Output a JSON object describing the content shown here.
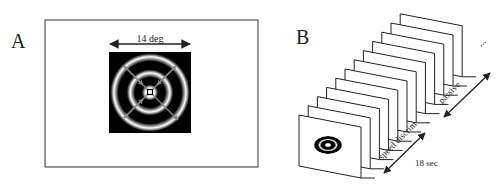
{
  "panel_a": {
    "label": "A",
    "width_label": "14 deg",
    "stimulus": "concentric-ring-grating",
    "motion_arrows": "radial-in-out"
  },
  "panel_b": {
    "label": "B",
    "frame_count": 12,
    "condition_1": "speed discrim",
    "condition_2": "passive",
    "duration_label": "18 sec",
    "continuation": "..."
  },
  "colors": {
    "background": "#ffffff",
    "line": "#222222",
    "arrow_gray": "#8a8a8a"
  }
}
